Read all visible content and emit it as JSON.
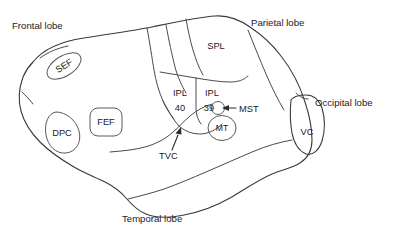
{
  "figure": {
    "background_color": "#ffffff",
    "outline_color": "#3a3a3a",
    "text_color": "#1a1a1a"
  },
  "lobes": [
    {
      "id": "frontal",
      "label": "Frontal lobe",
      "x": 12,
      "y": 29
    },
    {
      "id": "parietal",
      "label": "Parietal lobe",
      "x": 251,
      "y": 26
    },
    {
      "id": "occipital",
      "label": "Occipital lobe",
      "x": 315,
      "y": 106
    },
    {
      "id": "temporal",
      "label": "Temporal lobe",
      "x": 122,
      "y": 222
    }
  ],
  "regions": [
    {
      "id": "sef",
      "label": "SEF",
      "shape": "ellipse-rotated",
      "cx": 64,
      "cy": 66,
      "rx": 19,
      "ry": 10,
      "rotation": -32
    },
    {
      "id": "dpc",
      "label": "DPC",
      "shape": "blob",
      "cx": 63,
      "cy": 132,
      "rx": 17,
      "ry": 20
    },
    {
      "id": "fef",
      "label": "FEF",
      "shape": "rounded-rect",
      "cx": 106,
      "cy": 122,
      "w": 32,
      "h": 28
    },
    {
      "id": "spl",
      "label": "SPL",
      "shape": "area",
      "cx": 216,
      "cy": 45
    },
    {
      "id": "ipl40",
      "label": "IPL",
      "sublabel": "40",
      "shape": "area",
      "cx": 180,
      "cy": 97
    },
    {
      "id": "ipl39",
      "label": "IPL",
      "sublabel": "39",
      "shape": "area",
      "cx": 212,
      "cy": 97
    },
    {
      "id": "mt",
      "label": "MT",
      "shape": "ellipse",
      "cx": 222,
      "cy": 128,
      "rx": 14,
      "ry": 12
    },
    {
      "id": "vc",
      "label": "VC",
      "shape": "area",
      "cx": 307,
      "cy": 132
    }
  ],
  "callouts": [
    {
      "id": "mst",
      "label": "MST",
      "label_x": 239,
      "label_y": 112,
      "marker": {
        "cx": 218,
        "cy": 108,
        "r": 6.5
      },
      "leader": "M 236 108 L 224 108",
      "arrow_points": "224,108 230,105.5 230,110.5"
    },
    {
      "id": "tvc",
      "label": "TVC",
      "label_x": 159,
      "label_y": 159,
      "leader": "M 178 146 L 171 131",
      "arrow_points": "180,126 176,133 182.5,131.5"
    }
  ]
}
